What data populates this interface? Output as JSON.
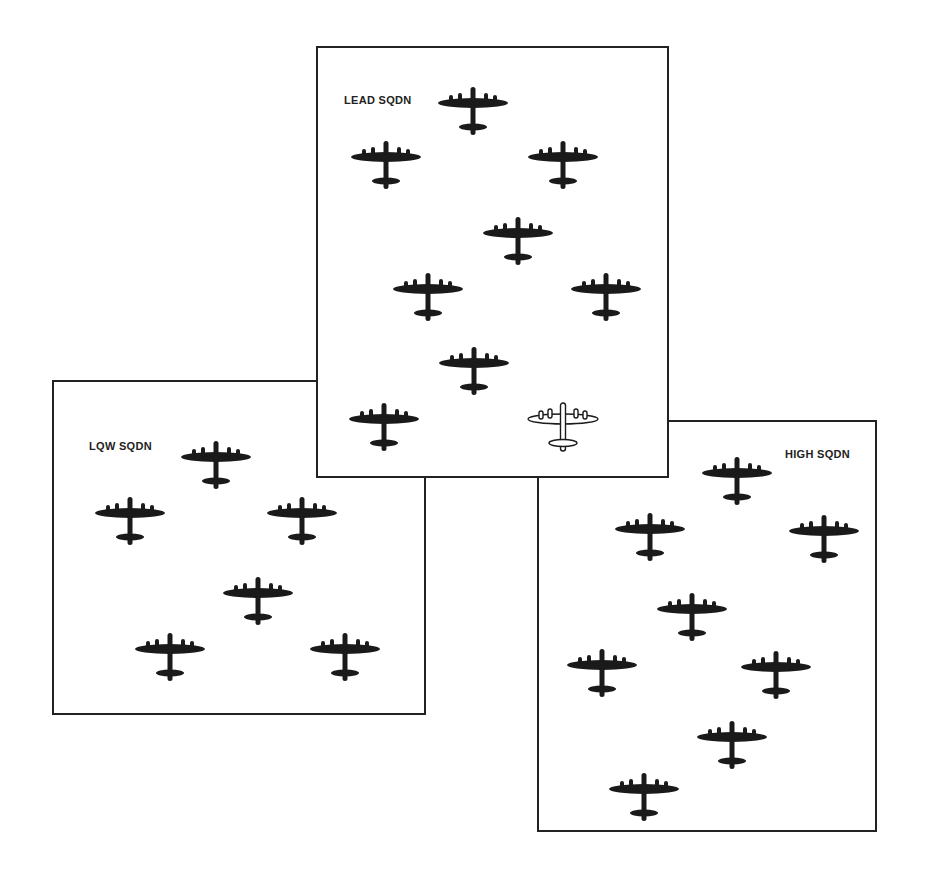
{
  "diagram": {
    "ink_color": "#1a1a1a",
    "squadrons": [
      {
        "id": "low",
        "label": "LQW SQDN",
        "aircraft_count": 6
      },
      {
        "id": "high",
        "label": "HIGH SQDN",
        "aircraft_count": 8
      },
      {
        "id": "lead",
        "label": "LEAD SQDN",
        "aircraft_count": 9,
        "lead_aircraft_style": "outlined"
      }
    ]
  }
}
